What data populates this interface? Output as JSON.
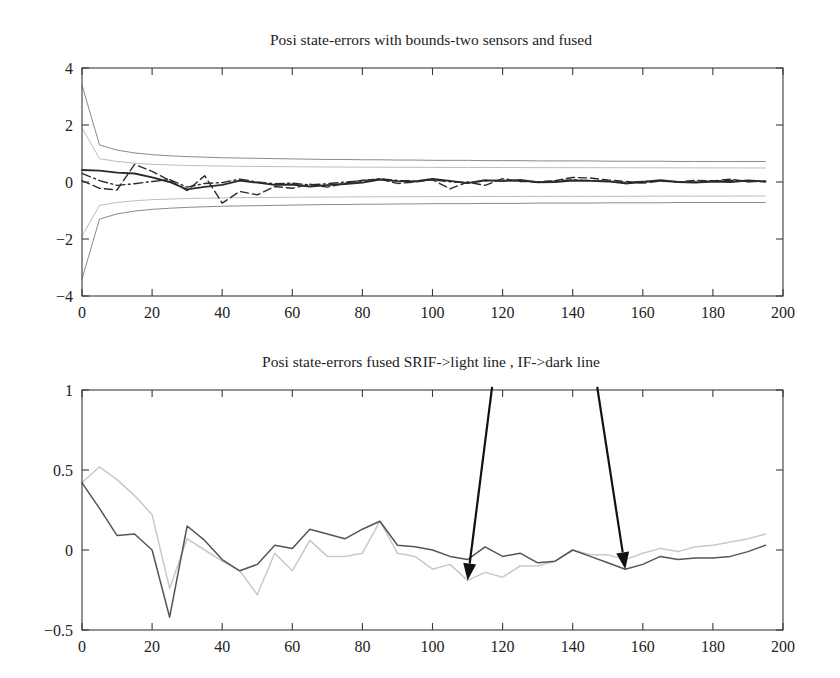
{
  "figure": {
    "width": 840,
    "height": 678,
    "background": "#ffffff"
  },
  "colors": {
    "axis": "#3a3a3a",
    "text": "#222222",
    "dark_line": "#555555",
    "light_line": "#c9c9c9",
    "bound_outer": "#8a8a8a",
    "bound_inner": "#bdbdbd",
    "trace_solid": "#2b2b2b",
    "trace_dashed": "#2b2b2b",
    "trace_dashdot": "#2b2b2b",
    "arrow": "#111111"
  },
  "chart_data": [
    {
      "id": "top-plot",
      "type": "line",
      "title": "Posi state-errors with bounds-two sensors and fused",
      "xlabel": "",
      "ylabel": "",
      "xlim": [
        0,
        200
      ],
      "ylim": [
        -4,
        4
      ],
      "xticks": [
        0,
        20,
        40,
        60,
        80,
        100,
        120,
        140,
        160,
        180,
        200
      ],
      "yticks": [
        -4,
        -2,
        0,
        2,
        4
      ],
      "xticklabels": [
        "0",
        "20",
        "40",
        "60",
        "80",
        "100",
        "120",
        "140",
        "160",
        "180",
        "200"
      ],
      "yticklabels": [
        "-4",
        "-2",
        "0",
        "2",
        "4"
      ],
      "grid": false,
      "legend": "none",
      "x": [
        0,
        5,
        10,
        15,
        20,
        25,
        30,
        35,
        40,
        45,
        50,
        55,
        60,
        65,
        70,
        75,
        80,
        85,
        90,
        95,
        100,
        105,
        110,
        115,
        120,
        125,
        130,
        135,
        140,
        145,
        150,
        155,
        160,
        165,
        170,
        175,
        180,
        185,
        190,
        195
      ],
      "series": [
        {
          "name": "sensor bound upper (outer)",
          "style": "solid",
          "color": "#8a8a8a",
          "values": [
            3.4,
            1.3,
            1.12,
            1.02,
            0.96,
            0.92,
            0.89,
            0.87,
            0.85,
            0.84,
            0.83,
            0.82,
            0.81,
            0.8,
            0.79,
            0.79,
            0.78,
            0.78,
            0.77,
            0.77,
            0.76,
            0.76,
            0.76,
            0.75,
            0.75,
            0.75,
            0.74,
            0.74,
            0.74,
            0.74,
            0.73,
            0.73,
            0.73,
            0.73,
            0.72,
            0.72,
            0.72,
            0.72,
            0.72,
            0.72
          ]
        },
        {
          "name": "sensor bound lower (outer)",
          "style": "solid",
          "color": "#8a8a8a",
          "values": [
            -3.4,
            -1.3,
            -1.12,
            -1.02,
            -0.96,
            -0.92,
            -0.89,
            -0.87,
            -0.85,
            -0.84,
            -0.83,
            -0.82,
            -0.81,
            -0.8,
            -0.79,
            -0.79,
            -0.78,
            -0.78,
            -0.77,
            -0.77,
            -0.76,
            -0.76,
            -0.76,
            -0.75,
            -0.75,
            -0.75,
            -0.74,
            -0.74,
            -0.74,
            -0.74,
            -0.73,
            -0.73,
            -0.73,
            -0.73,
            -0.72,
            -0.72,
            -0.72,
            -0.72,
            -0.72,
            -0.72
          ]
        },
        {
          "name": "fused bound upper (inner)",
          "style": "solid",
          "color": "#bdbdbd",
          "values": [
            1.9,
            0.82,
            0.72,
            0.66,
            0.62,
            0.6,
            0.58,
            0.57,
            0.56,
            0.55,
            0.545,
            0.54,
            0.535,
            0.53,
            0.527,
            0.524,
            0.521,
            0.519,
            0.517,
            0.515,
            0.513,
            0.511,
            0.51,
            0.508,
            0.507,
            0.506,
            0.505,
            0.504,
            0.503,
            0.502,
            0.501,
            0.5,
            0.499,
            0.498,
            0.497,
            0.496,
            0.495,
            0.494,
            0.493,
            0.492
          ]
        },
        {
          "name": "fused bound lower (inner)",
          "style": "solid",
          "color": "#bdbdbd",
          "values": [
            -1.9,
            -0.82,
            -0.72,
            -0.66,
            -0.62,
            -0.6,
            -0.58,
            -0.57,
            -0.56,
            -0.55,
            -0.545,
            -0.54,
            -0.535,
            -0.53,
            -0.527,
            -0.524,
            -0.521,
            -0.519,
            -0.517,
            -0.515,
            -0.513,
            -0.511,
            -0.51,
            -0.508,
            -0.507,
            -0.506,
            -0.505,
            -0.504,
            -0.503,
            -0.502,
            -0.501,
            -0.5,
            -0.499,
            -0.498,
            -0.497,
            -0.496,
            -0.495,
            -0.494,
            -0.493,
            -0.492
          ]
        },
        {
          "name": "fused state-error (solid)",
          "style": "solid",
          "color": "#2b2b2b",
          "values": [
            0.42,
            0.4,
            0.33,
            0.3,
            0.16,
            0.0,
            -0.26,
            -0.17,
            -0.1,
            0.05,
            -0.02,
            -0.1,
            -0.09,
            -0.16,
            -0.11,
            -0.07,
            -0.02,
            0.09,
            0.03,
            0.02,
            0.11,
            0.04,
            -0.04,
            0.06,
            0.03,
            0.07,
            -0.01,
            0.0,
            0.05,
            0.04,
            0.02,
            -0.05,
            0.0,
            0.06,
            0.0,
            -0.02,
            0.02,
            0.0,
            0.05,
            0.02
          ]
        },
        {
          "name": "sensor-1 state-error (dashed)",
          "style": "dashed",
          "color": "#2b2b2b",
          "values": [
            0.05,
            -0.22,
            -0.28,
            0.62,
            0.37,
            0.05,
            -0.3,
            0.22,
            -0.74,
            -0.33,
            -0.45,
            -0.16,
            -0.22,
            -0.08,
            -0.18,
            -0.04,
            0.06,
            0.1,
            -0.05,
            0.0,
            0.08,
            -0.24,
            0.0,
            -0.12,
            0.12,
            0.02,
            0.0,
            0.05,
            0.16,
            0.14,
            0.07,
            0.02,
            -0.04,
            0.03,
            0.0,
            0.06,
            0.04,
            0.1,
            0.01,
            0.03
          ]
        },
        {
          "name": "sensor-2 state-error (dash-dot)",
          "style": "dashdot",
          "color": "#2b2b2b",
          "values": [
            0.3,
            0.05,
            -0.12,
            -0.06,
            0.02,
            0.08,
            -0.18,
            -0.05,
            -0.02,
            0.1,
            0.0,
            -0.06,
            -0.04,
            -0.1,
            -0.06,
            0.0,
            0.04,
            0.12,
            0.05,
            0.04,
            0.07,
            0.01,
            -0.02,
            0.04,
            0.07,
            0.03,
            0.01,
            0.03,
            0.08,
            0.05,
            0.03,
            -0.02,
            0.02,
            0.04,
            0.01,
            0.0,
            0.03,
            0.06,
            0.02,
            0.01
          ]
        }
      ]
    },
    {
      "id": "bottom-plot",
      "type": "line",
      "title": "Posi state-errors fused SRIF->light line , IF->dark line",
      "xlabel": "",
      "ylabel": "",
      "xlim": [
        0,
        200
      ],
      "ylim": [
        -0.5,
        1
      ],
      "xticks": [
        0,
        20,
        40,
        60,
        80,
        100,
        120,
        140,
        160,
        180,
        200
      ],
      "yticks": [
        -0.5,
        0,
        0.5,
        1
      ],
      "xticklabels": [
        "0",
        "20",
        "40",
        "60",
        "80",
        "100",
        "120",
        "140",
        "160",
        "180",
        "200"
      ],
      "yticklabels": [
        "-0.5",
        "0",
        "0.5",
        "1"
      ],
      "grid": false,
      "legend": "none",
      "x": [
        0,
        5,
        10,
        15,
        20,
        25,
        30,
        35,
        40,
        45,
        50,
        55,
        60,
        65,
        70,
        75,
        80,
        85,
        90,
        95,
        100,
        105,
        110,
        115,
        120,
        125,
        130,
        135,
        140,
        145,
        150,
        155,
        160,
        165,
        170,
        175,
        180,
        185,
        190,
        195
      ],
      "series": [
        {
          "name": "SRIF fused (light line)",
          "style": "solid",
          "color": "#c9c9c9",
          "values": [
            0.42,
            0.52,
            0.44,
            0.34,
            0.22,
            -0.24,
            0.07,
            0.0,
            -0.07,
            -0.13,
            -0.28,
            -0.02,
            -0.13,
            0.06,
            -0.04,
            -0.04,
            -0.02,
            0.18,
            -0.02,
            -0.04,
            -0.12,
            -0.09,
            -0.19,
            -0.14,
            -0.17,
            -0.1,
            -0.1,
            -0.07,
            0.0,
            -0.03,
            -0.03,
            -0.06,
            -0.02,
            0.01,
            -0.01,
            0.02,
            0.03,
            0.05,
            0.07,
            0.1
          ]
        },
        {
          "name": "IF fused (dark line)",
          "style": "solid",
          "color": "#555555",
          "values": [
            0.42,
            0.26,
            0.09,
            0.1,
            0.0,
            -0.42,
            0.15,
            0.06,
            -0.06,
            -0.13,
            -0.09,
            0.03,
            0.01,
            0.13,
            0.1,
            0.07,
            0.13,
            0.18,
            0.03,
            0.02,
            0.0,
            -0.04,
            -0.06,
            0.02,
            -0.04,
            -0.02,
            -0.08,
            -0.07,
            0.0,
            -0.04,
            -0.08,
            -0.12,
            -0.09,
            -0.04,
            -0.06,
            -0.05,
            -0.05,
            -0.04,
            -0.01,
            0.03
          ]
        }
      ],
      "annotations": [
        {
          "name": "arrow-to-light-line",
          "label": "",
          "from_x": 117,
          "from_y": 1.02,
          "to_x": 110,
          "to_y": -0.19
        },
        {
          "name": "arrow-to-dark-line",
          "label": "",
          "from_x": 147,
          "from_y": 1.02,
          "to_x": 155,
          "to_y": -0.12
        }
      ]
    }
  ]
}
